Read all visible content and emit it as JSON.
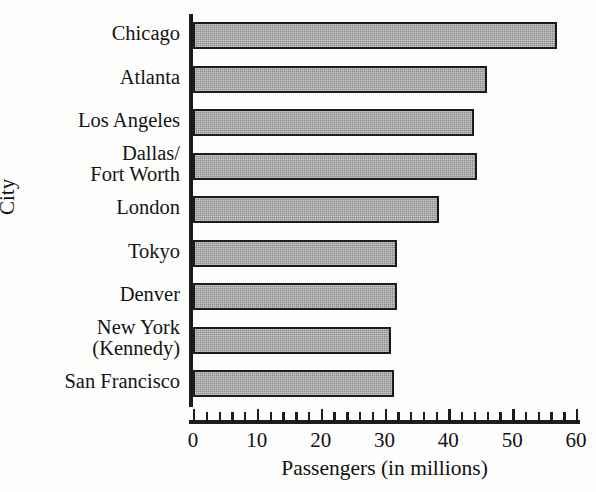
{
  "chart_data": {
    "type": "bar",
    "orientation": "horizontal",
    "title": "",
    "xlabel": "Passengers (in millions)",
    "ylabel": "City",
    "xlim": [
      0,
      60
    ],
    "xticks": [
      0,
      10,
      20,
      30,
      40,
      50,
      60
    ],
    "xtick_labels": [
      "0",
      "10",
      "20",
      "30",
      "40",
      "50",
      "60"
    ],
    "minor_tick_step": 2,
    "grid": false,
    "legend": false,
    "bar_fill_color": "#8d8d8d",
    "bar_edge_color": "#1b1b1b",
    "categories": [
      "Chicago",
      "Atlanta",
      "Los Angeles",
      "Dallas/\nFort Worth",
      "London",
      "Tokyo",
      "Denver",
      "New York\n(Kennedy)",
      "San Francisco"
    ],
    "values": [
      57,
      46,
      44,
      44.5,
      38.5,
      32,
      32,
      31,
      31.5
    ]
  }
}
